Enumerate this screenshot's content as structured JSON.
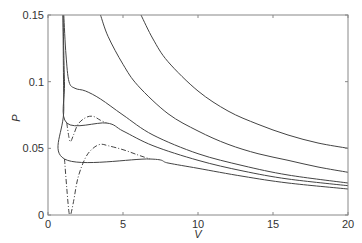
{
  "chart_data": {
    "type": "line",
    "title": "",
    "xlabel": "V",
    "ylabel": "P",
    "xlim": [
      0,
      20
    ],
    "ylim": [
      0,
      0.15
    ],
    "grid": false,
    "legend": null,
    "x_ticks": [
      "0",
      "5",
      "10",
      "15",
      "20"
    ],
    "x_tick_values": [
      0,
      5,
      10,
      15,
      20
    ],
    "y_ticks": [
      "0",
      "0.05",
      "0.1",
      "0.15"
    ],
    "y_tick_values": [
      0,
      0.05,
      0.1,
      0.15
    ],
    "series": [
      {
        "name": "isotherm-highest",
        "style": "solid",
        "points": [
          [
            6.2,
            0.15
          ],
          [
            7,
            0.132
          ],
          [
            8,
            0.115
          ],
          [
            10,
            0.093
          ],
          [
            12,
            0.078
          ],
          [
            14,
            0.068
          ],
          [
            16,
            0.06
          ],
          [
            18,
            0.054
          ],
          [
            20,
            0.05
          ]
        ]
      },
      {
        "name": "isotherm-high",
        "style": "solid",
        "points": [
          [
            1.15,
            0.15
          ],
          [
            1.3,
            0.13
          ],
          [
            1.6,
            0.118
          ],
          [
            2,
            0.112
          ],
          [
            2.6,
            0.106
          ],
          [
            3.5,
            0.15
          ]
        ],
        "note": "placeholder"
      },
      {
        "name": "isotherm-above-critical",
        "style": "solid",
        "points": [
          [
            3.5,
            0.15
          ],
          [
            4,
            0.134
          ],
          [
            5,
            0.113
          ],
          [
            6,
            0.097
          ],
          [
            8,
            0.076
          ],
          [
            10,
            0.063
          ],
          [
            12,
            0.053
          ],
          [
            14,
            0.046
          ],
          [
            16,
            0.041
          ],
          [
            18,
            0.036
          ],
          [
            20,
            0.032
          ]
        ]
      },
      {
        "name": "isotherm-critical",
        "style": "solid",
        "points": [
          [
            1.05,
            0.15
          ],
          [
            1.2,
            0.12
          ],
          [
            1.4,
            0.1
          ],
          [
            1.8,
            0.095
          ],
          [
            2.5,
            0.093
          ],
          [
            3.5,
            0.087
          ],
          [
            5,
            0.075
          ],
          [
            7,
            0.06
          ],
          [
            10,
            0.046
          ],
          [
            13,
            0.037
          ],
          [
            16,
            0.03
          ],
          [
            20,
            0.024
          ]
        ]
      },
      {
        "name": "isotherm-subcritical-1",
        "style": "solid",
        "points": [
          [
            1.0,
            0.15
          ],
          [
            1.1,
            0.1
          ],
          [
            1.25,
            0.069
          ],
          [
            3.9,
            0.069
          ],
          [
            5,
            0.063
          ],
          [
            7,
            0.052
          ],
          [
            10,
            0.041
          ],
          [
            13,
            0.033
          ],
          [
            16,
            0.027
          ],
          [
            20,
            0.022
          ]
        ]
      },
      {
        "name": "isotherm-subcritical-1-vdw",
        "style": "dashdot",
        "points": [
          [
            1.25,
            0.069
          ],
          [
            1.4,
            0.058
          ],
          [
            1.5,
            0.055
          ],
          [
            1.7,
            0.06
          ],
          [
            2,
            0.068
          ],
          [
            2.5,
            0.073
          ],
          [
            3,
            0.074
          ],
          [
            3.5,
            0.071
          ],
          [
            3.9,
            0.069
          ]
        ]
      },
      {
        "name": "isotherm-subcritical-2",
        "style": "solid",
        "points": [
          [
            1.0,
            0.15
          ],
          [
            1.05,
            0.08
          ],
          [
            1.1,
            0.042
          ],
          [
            6.8,
            0.042
          ],
          [
            8,
            0.039
          ],
          [
            10,
            0.035
          ],
          [
            13,
            0.029
          ],
          [
            16,
            0.024
          ],
          [
            20,
            0.0195
          ]
        ]
      },
      {
        "name": "isotherm-subcritical-2-vdw",
        "style": "dashdot",
        "points": [
          [
            1.1,
            0.042
          ],
          [
            1.25,
            0.02
          ],
          [
            1.4,
            0.002
          ],
          [
            1.5,
            0.0
          ],
          [
            1.7,
            0.01
          ],
          [
            2,
            0.028
          ],
          [
            2.5,
            0.043
          ],
          [
            3,
            0.05
          ],
          [
            3.5,
            0.053
          ],
          [
            4,
            0.052
          ],
          [
            5,
            0.049
          ],
          [
            6,
            0.045
          ],
          [
            6.8,
            0.042
          ]
        ]
      }
    ]
  },
  "axes": {
    "xlabel": "V",
    "ylabel": "P"
  }
}
